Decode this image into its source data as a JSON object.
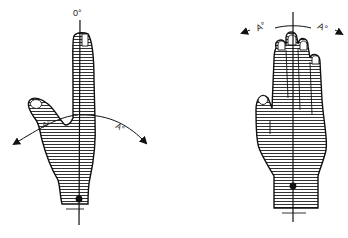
{
  "figure": {
    "left_hand": {
      "description": "Hand with index finger extended upright, thumb abducted; vertical midline reference axis",
      "zero_label": "0°",
      "left_angle_label": "A°",
      "right_angle_label": "A°"
    },
    "right_hand": {
      "description": "Open hand, fingers together, vertical midline reference axis through middle finger",
      "left_angle_label": "A°",
      "right_angle_label": "A°"
    },
    "colors": {
      "ink": "#111111",
      "hatch": "#333333",
      "background": "#ffffff"
    }
  }
}
